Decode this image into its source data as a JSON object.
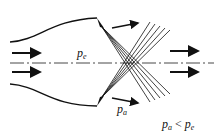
{
  "diagram": {
    "labels": {
      "exit_pressure": {
        "base": "p",
        "sub": "e"
      },
      "ambient_pressure": {
        "base": "p",
        "sub": "a"
      },
      "condition": {
        "lhs_base": "p",
        "lhs_sub": "a",
        "op": "<",
        "rhs_base": "p",
        "rhs_sub": "e"
      }
    },
    "colors": {
      "stroke": "#111111",
      "centerline": "#333333"
    }
  }
}
